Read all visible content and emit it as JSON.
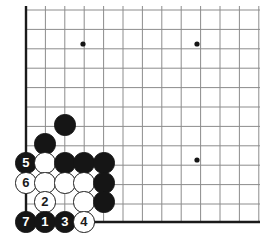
{
  "figure": {
    "board_size": 19,
    "visible_region": "lower-left corner",
    "colors": {
      "black_stone": "#151515",
      "white_stone": "#ffffff",
      "stone_outline": "#1a1a1a",
      "grid_line": "#8c8c8c",
      "edge_line": "#1a1a1a",
      "background": "#ffffff",
      "hoshi": "#151515"
    }
  },
  "board": {
    "origin_x": 26,
    "origin_y": 10,
    "spacing": 19.4,
    "cols": 13,
    "rows": 12,
    "edge_left_x": 26,
    "edge_bottom_y": 222,
    "stone_radius": 10.6,
    "hoshi_radius": 2.6,
    "hoshi_points": [
      {
        "name": "hoshi-upper-left",
        "cx": 83,
        "cy": 44
      },
      {
        "name": "hoshi-upper-right",
        "cx": 197,
        "cy": 44
      },
      {
        "name": "hoshi-lower-right",
        "cx": 197,
        "cy": 160
      }
    ]
  },
  "stones": [
    {
      "id": "black-plain-d7",
      "color": "black",
      "cx": 65,
      "cy": 125,
      "label": ""
    },
    {
      "id": "black-plain-c6",
      "color": "black",
      "cx": 45,
      "cy": 144,
      "label": ""
    },
    {
      "id": "black-move-5",
      "color": "black",
      "cx": 26,
      "cy": 163,
      "label": "5"
    },
    {
      "id": "white-plain-c5",
      "color": "white",
      "cx": 45,
      "cy": 163,
      "label": ""
    },
    {
      "id": "black-plain-d5",
      "color": "black",
      "cx": 65,
      "cy": 163,
      "label": ""
    },
    {
      "id": "black-plain-e5",
      "color": "black",
      "cx": 84,
      "cy": 163,
      "label": ""
    },
    {
      "id": "black-plain-f5",
      "color": "black",
      "cx": 104,
      "cy": 163,
      "label": ""
    },
    {
      "id": "white-move-6",
      "color": "white",
      "cx": 26,
      "cy": 183,
      "label": "6"
    },
    {
      "id": "white-plain-c4",
      "color": "white",
      "cx": 45,
      "cy": 183,
      "label": ""
    },
    {
      "id": "white-plain-d4",
      "color": "white",
      "cx": 65,
      "cy": 183,
      "label": ""
    },
    {
      "id": "white-plain-e4",
      "color": "white",
      "cx": 84,
      "cy": 183,
      "label": ""
    },
    {
      "id": "black-plain-f4",
      "color": "black",
      "cx": 104,
      "cy": 183,
      "label": ""
    },
    {
      "id": "white-move-2",
      "color": "white",
      "cx": 45,
      "cy": 202,
      "label": "2"
    },
    {
      "id": "white-plain-e3",
      "color": "white",
      "cx": 84,
      "cy": 202,
      "label": ""
    },
    {
      "id": "black-plain-f3",
      "color": "black",
      "cx": 104,
      "cy": 202,
      "label": ""
    },
    {
      "id": "black-move-7",
      "color": "black",
      "cx": 26,
      "cy": 222,
      "label": "7"
    },
    {
      "id": "black-move-1",
      "color": "black",
      "cx": 45,
      "cy": 222,
      "label": "1"
    },
    {
      "id": "black-move-3",
      "color": "black",
      "cx": 65,
      "cy": 222,
      "label": "3"
    },
    {
      "id": "white-move-4",
      "color": "white",
      "cx": 84,
      "cy": 222,
      "label": "4"
    }
  ]
}
